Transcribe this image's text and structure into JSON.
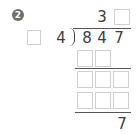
{
  "problem": {
    "number_badge": "2",
    "quotient": {
      "known_digit": "3",
      "blank_count": 1
    },
    "divisor": {
      "blank_count": 1,
      "known_digit": "4"
    },
    "dividend": [
      "8",
      "4",
      "7"
    ],
    "work_rows": [
      {
        "blanks": 2
      },
      {
        "blanks": 3
      },
      {
        "blanks": 3
      }
    ],
    "remainder": "7"
  },
  "colors": {
    "badge": "#6e6e6e",
    "box_border": "#cfcfcf",
    "text": "#3d3d3d"
  }
}
